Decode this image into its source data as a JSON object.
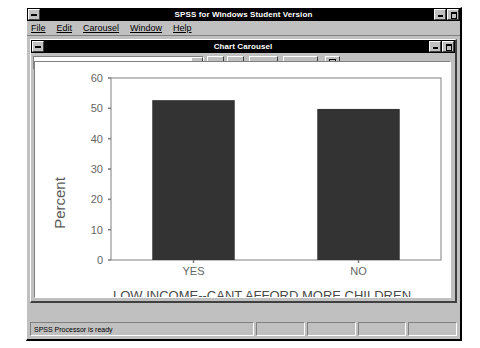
{
  "app_window": {
    "title": "SPSS for Windows Student Version",
    "sysmenu_icon": "system-menu-icon",
    "minimize_icon": "minimize-icon",
    "maximize_icon": "maximize-icon"
  },
  "menubar": {
    "items": [
      {
        "label": "File",
        "mnemonic": "F"
      },
      {
        "label": "Edit",
        "mnemonic": "E"
      },
      {
        "label": "Carousel",
        "mnemonic": "C"
      },
      {
        "label": "Window",
        "mnemonic": "W"
      },
      {
        "label": "Help",
        "mnemonic": "H"
      }
    ]
  },
  "chart_window": {
    "title": "Chart Carousel",
    "sysmenu_icon": "system-menu-icon",
    "minimize_icon": "minimize-icon",
    "maximize_icon": "maximize-icon",
    "toolbar": {
      "chart_selector": {
        "value": "2:Bar of pct by abpoor",
        "placeholder": "",
        "dropdown_icon": "chevron-down-icon"
      },
      "prev_label": "▲",
      "next_label": "▼",
      "edit_label": "Edit",
      "discard_label": "Discard",
      "print_icon": "print-icon"
    }
  },
  "statusbar": {
    "message": "SPSS Processor is ready",
    "segments": [
      "",
      "",
      "",
      ""
    ]
  },
  "chart_data": {
    "type": "bar",
    "title": "",
    "categories": [
      "YES",
      "NO"
    ],
    "values": [
      52.7,
      49.8
    ],
    "series": [
      {
        "name": "Percent",
        "values": [
          52.7,
          49.8
        ]
      }
    ],
    "xlabel": "LOW INCOME--CANT AFFORD MORE CHILDREN",
    "ylabel": "Percent",
    "ylim": [
      0,
      60
    ],
    "yticks": [
      0,
      10,
      20,
      30,
      40,
      50,
      60
    ],
    "grid": false,
    "legend": false,
    "bar_color": "#333333",
    "axis_color": "#808080",
    "text_color": "#666666"
  }
}
